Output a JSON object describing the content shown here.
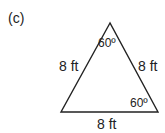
{
  "figure": {
    "part_label": "(c)",
    "shape": "equilateral-triangle",
    "sides": {
      "left": "8 ft",
      "right": "8 ft",
      "bottom": "8 ft"
    },
    "angles": {
      "top": "60º",
      "bottom_right": "60º"
    },
    "stroke_color": "#222222"
  }
}
